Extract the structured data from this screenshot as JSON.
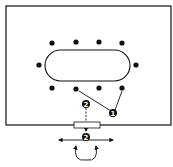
{
  "diagram": {
    "room": {
      "label": "room"
    },
    "table": {
      "label": "table",
      "shape": "stadium"
    },
    "seats": {
      "top_row_count": 4,
      "bottom_row_count": 4,
      "side_count": 2
    },
    "markers": [
      {
        "id": "marker-1",
        "label": "1"
      },
      {
        "id": "marker-2-inside",
        "label": "2"
      },
      {
        "id": "marker-2-outside",
        "label": "2"
      }
    ],
    "door": {
      "label": "door"
    },
    "colors": {
      "ink": "#111111",
      "background": "#ffffff",
      "door_fill": "#ffffff"
    }
  }
}
